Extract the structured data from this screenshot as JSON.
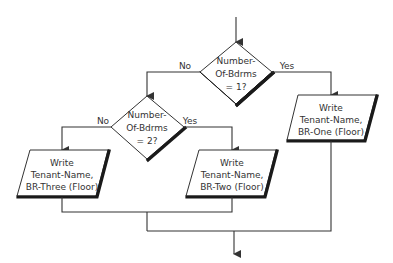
{
  "diagram": {
    "type": "flowchart",
    "decisions": [
      {
        "id": "decision-1",
        "lines": [
          "Number-",
          "Of-Bdrms",
          "= 1?"
        ],
        "no_label": "No",
        "yes_label": "Yes"
      },
      {
        "id": "decision-2",
        "lines": [
          "Number-",
          "Of-Bdrms",
          "= 2?"
        ],
        "no_label": "No",
        "yes_label": "Yes"
      }
    ],
    "outputs": [
      {
        "id": "output-br-one",
        "lines": [
          "Write",
          "Tenant-Name,",
          "BR-One (Floor)"
        ]
      },
      {
        "id": "output-br-two",
        "lines": [
          "Write",
          "Tenant-Name,",
          "BR-Two (Floor)"
        ]
      },
      {
        "id": "output-br-three",
        "lines": [
          "Write",
          "Tenant-Name,",
          "BR-Three (Floor)"
        ]
      }
    ]
  }
}
